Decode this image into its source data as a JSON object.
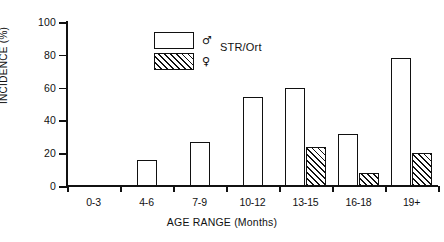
{
  "chart_data": {
    "type": "bar",
    "title": "",
    "subtitle": "",
    "xlabel": "AGE RANGE (Months)",
    "ylabel": "INCIDENCE (%)",
    "categories": [
      "0-3",
      "4-6",
      "7-9",
      "10-12",
      "13-15",
      "16-18",
      "19+"
    ],
    "series": [
      {
        "name": "♂",
        "style": "open",
        "values": [
          0,
          16,
          27,
          54,
          60,
          32,
          78
        ]
      },
      {
        "name": "♀",
        "style": "hatched",
        "values": [
          0,
          0,
          0,
          0,
          24,
          8,
          20
        ]
      }
    ],
    "ylim": [
      0,
      100
    ],
    "yticks": [
      0,
      20,
      40,
      60,
      80,
      100
    ],
    "ytick_labels": [
      "0",
      "20",
      "40",
      "60",
      "80",
      "100"
    ],
    "grid": false,
    "legend_position": "upper-center",
    "legend_group_label": "STR/Ort",
    "colors": {
      "line": "#111111",
      "fill_open": "#ffffff",
      "fill_hatched": "#ffffff",
      "background": "#ffffff"
    }
  },
  "legend": {
    "male_symbol": "♂",
    "female_symbol": "♀",
    "group_label": "STR/Ort"
  }
}
